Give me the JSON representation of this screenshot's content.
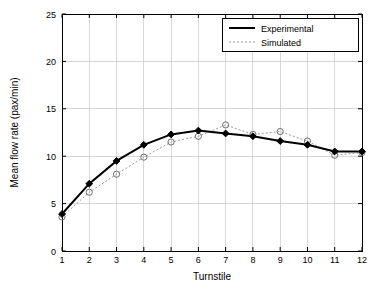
{
  "chart_data": {
    "type": "line",
    "title": "",
    "xlabel": "Turnstile",
    "ylabel": "Mean flow rate (pax/min)",
    "x": [
      1,
      2,
      3,
      4,
      5,
      6,
      7,
      8,
      9,
      10,
      11,
      12
    ],
    "xticklabels": [
      "1",
      "2",
      "3",
      "4",
      "5",
      "6",
      "7",
      "8",
      "9",
      "10",
      "11",
      "12"
    ],
    "yticklabels": [
      "0",
      "5",
      "10",
      "15",
      "20",
      "25"
    ],
    "xlim": [
      1,
      12
    ],
    "ylim": [
      0,
      25
    ],
    "grid": true,
    "legend_position": "top-right",
    "series": [
      {
        "name": "Experimental",
        "color": "#000000",
        "style": "solid",
        "marker": "diamond-filled",
        "values": [
          3.9,
          7.1,
          9.5,
          11.2,
          12.3,
          12.7,
          12.4,
          12.1,
          11.6,
          11.2,
          10.5,
          10.5
        ]
      },
      {
        "name": "Simulated",
        "color": "#9a9a9a",
        "style": "dotted",
        "marker": "circle-open",
        "values": [
          3.6,
          6.2,
          8.1,
          9.9,
          11.5,
          12.1,
          13.3,
          12.3,
          12.6,
          11.6,
          10.1,
          10.4
        ]
      }
    ]
  }
}
